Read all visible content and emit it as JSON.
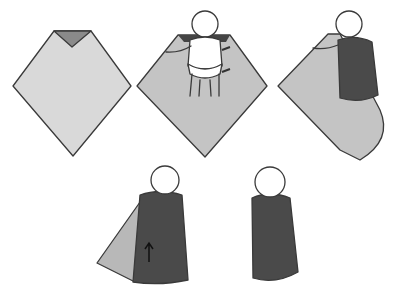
{
  "diagram": {
    "steps": [
      {
        "step": 1,
        "description": "Blanket laid as a diamond with top corner folded down"
      },
      {
        "step": 2,
        "description": "Baby placed on blanket, right arm out, arrows showing fold"
      },
      {
        "step": 3,
        "description": "Left side wrapped over baby, bottom corner remaining"
      },
      {
        "step": 4,
        "description": "Bottom folded up (arrow), right side ready to wrap"
      },
      {
        "step": 5,
        "description": "Baby fully swaddled"
      }
    ]
  },
  "colors": {
    "blanket_light": "#d8d8d8",
    "blanket_mid": "#b8b8b8",
    "wrap_dark": "#4a4a4a",
    "fold_dark": "#6a6a6a",
    "outline": "#3a3a3a",
    "skin": "#ffffff"
  }
}
